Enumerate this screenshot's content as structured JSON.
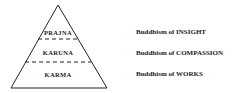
{
  "pyramid": {
    "levels": [
      {
        "label": "PRAJNA",
        "description": "Buddhism of INSIGHT"
      },
      {
        "label": "KARUNA",
        "description": "Buddhism of COMPASSION"
      },
      {
        "label": "KARMA",
        "description": "Buddhism of WORKS"
      }
    ]
  }
}
